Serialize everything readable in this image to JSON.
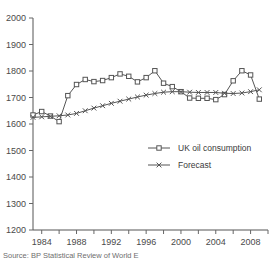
{
  "chart_data": {
    "type": "line",
    "title": "",
    "xlabel": "",
    "ylabel": "",
    "xlim": [
      1983,
      2010
    ],
    "ylim": [
      1200,
      2000
    ],
    "grid": false,
    "legend_position": "center-right",
    "y_ticks": [
      1200,
      1300,
      1400,
      1500,
      1600,
      1700,
      1800,
      1900,
      2000
    ],
    "x_ticks": [
      1984,
      1986,
      1988,
      1990,
      1992,
      1994,
      1996,
      1998,
      2000,
      2002,
      2004,
      2006,
      2008,
      2010
    ],
    "x_tick_labels": [
      "1984",
      "",
      "1988",
      "",
      "1992",
      "",
      "1996",
      "",
      "2000",
      "",
      "2004",
      "",
      "2008",
      ""
    ],
    "x": [
      1983,
      1984,
      1985,
      1986,
      1987,
      1988,
      1989,
      1990,
      1991,
      1992,
      1993,
      1994,
      1995,
      1996,
      1997,
      1998,
      1999,
      2000,
      2001,
      2002,
      2003,
      2004,
      2005,
      2006,
      2007,
      2008,
      2009
    ],
    "series": [
      {
        "name": "UK oil consumption",
        "marker": "square",
        "values": [
          1634,
          1647,
          1630,
          1609,
          1707,
          1749,
          1768,
          1760,
          1764,
          1775,
          1789,
          1780,
          1759,
          1775,
          1801,
          1754,
          1741,
          1722,
          1698,
          1697,
          1697,
          1692,
          1711,
          1763,
          1801,
          1785,
          1694
        ]
      },
      {
        "name": "Forecast",
        "marker": "cross",
        "values": [
          1625,
          1627,
          1629,
          1631,
          1634,
          1640,
          1650,
          1660,
          1669,
          1678,
          1686,
          1694,
          1702,
          1709,
          1715,
          1720,
          1722,
          1722,
          1720,
          1719,
          1719,
          1719,
          1716,
          1715,
          1717,
          1722,
          1729
        ]
      }
    ]
  },
  "legend": {
    "items": [
      {
        "label": "UK oil consumption"
      },
      {
        "label": "Forecast"
      }
    ]
  },
  "source": {
    "text": "Source: BP Statistical Review of World E"
  }
}
